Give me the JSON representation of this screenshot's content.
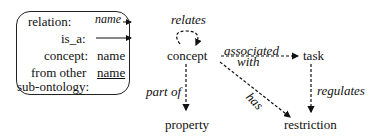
{
  "legend": {
    "rows": [
      {
        "label": "relation:",
        "value": "name",
        "style": "italic-arrow"
      },
      {
        "label": "is_a:",
        "value": "",
        "style": "solid-arrow"
      },
      {
        "label": "concept:",
        "value": "name",
        "style": "plain"
      },
      {
        "label": "from other",
        "value": "name",
        "style": "underline"
      },
      {
        "label": "sub-ontology:",
        "value": "",
        "style": "plain"
      }
    ]
  },
  "diagram": {
    "nodes": {
      "concept": "concept",
      "task": "task",
      "property": "property",
      "restriction": "restriction"
    },
    "relations": {
      "relates": "relates",
      "associated": "associated",
      "with": "with",
      "part_of": "part of",
      "has": "has",
      "regulates": "regulates"
    }
  }
}
